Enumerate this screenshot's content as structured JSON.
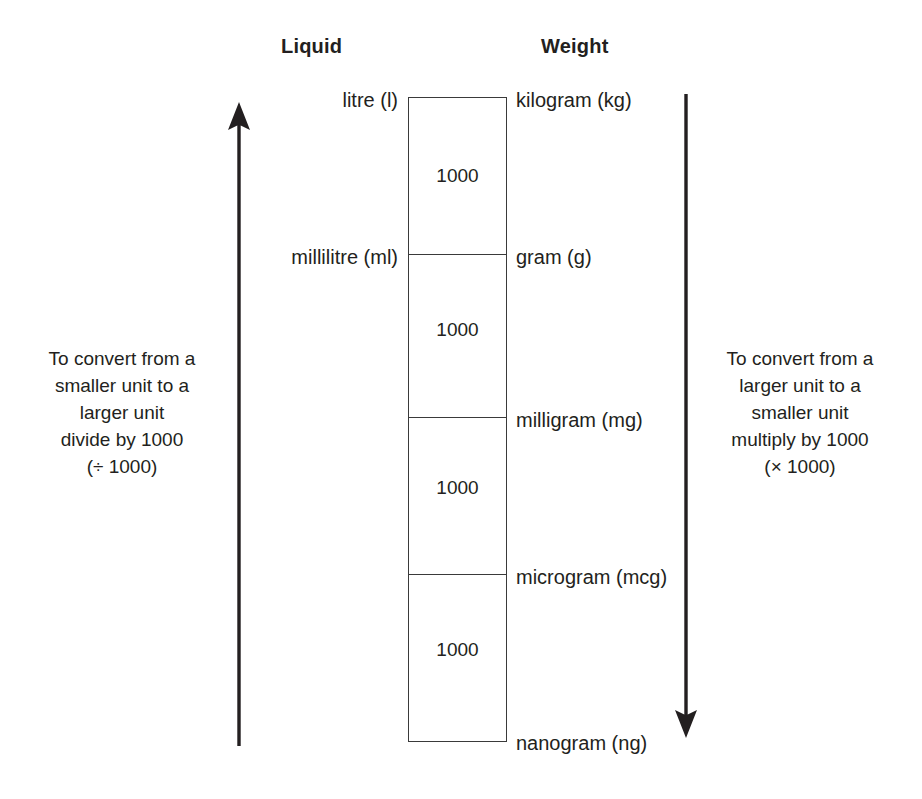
{
  "columns": {
    "liquid_header": "Liquid",
    "weight_header": "Weight"
  },
  "liquid_units": [
    {
      "label": "litre (l)"
    },
    {
      "label": "millilitre (ml)"
    }
  ],
  "weight_units": [
    {
      "label": "kilogram (kg)"
    },
    {
      "label": "gram (g)"
    },
    {
      "label": "milligram (mg)"
    },
    {
      "label": "microgram (mcg)"
    },
    {
      "label": "nanogram (ng)"
    }
  ],
  "ladder": {
    "factors": [
      "1000",
      "1000",
      "1000",
      "1000"
    ],
    "line_color": "#3a3a3a"
  },
  "left_note": {
    "line1": "To convert from a",
    "line2": "smaller unit to a",
    "line3": "larger unit",
    "line4": "divide by 1000",
    "line5": "(÷ 1000)"
  },
  "right_note": {
    "line1": "To convert from a",
    "line2": "larger unit to a",
    "line3": "smaller unit",
    "line4": "multiply by 1000",
    "line5": "(× 1000)"
  },
  "arrows": {
    "left_direction": "up",
    "right_direction": "down",
    "color": "#231f20"
  }
}
